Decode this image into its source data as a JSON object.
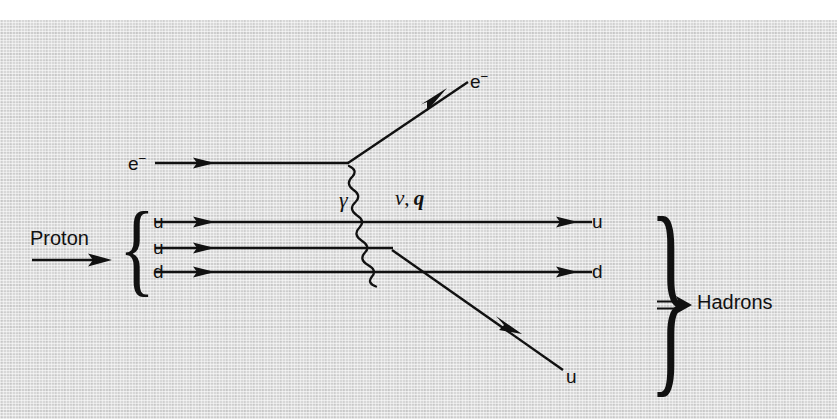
{
  "figure": {
    "kind": "feynman-diagram",
    "background_color": "#d8d8d8",
    "ink_color": "#111111",
    "width": 837,
    "height": 419
  },
  "labels": {
    "incoming_electron": "e",
    "incoming_electron_charge": "−",
    "outgoing_electron": "e",
    "outgoing_electron_charge": "−",
    "photon": "γ",
    "momentum_transfer_nu": "ν",
    "momentum_transfer_sep": ", ",
    "momentum_transfer_q": "q",
    "proton": "Proton",
    "hadrons": "Hadrons",
    "hadrons_arrow": "⇒",
    "quark_in_1": "u",
    "quark_in_2": "u",
    "quark_in_3": "d",
    "quark_out_1": "u",
    "quark_out_2": "d",
    "quark_out_struck": "u",
    "left_brace": "{",
    "right_brace": "}"
  },
  "geometry": {
    "electron_in_line": {
      "x1": 155,
      "y1": 163,
      "x2": 348,
      "y2": 163
    },
    "electron_in_arrow_at": {
      "x": 205,
      "y": 163
    },
    "electron_out_line": {
      "x1": 348,
      "y1": 163,
      "x2": 470,
      "y2": 80
    },
    "electron_out_arrow_at": {
      "x": 442,
      "y": 99
    },
    "photon_wave": {
      "x1": 348,
      "y1": 166,
      "x2": 392,
      "y2": 252,
      "amplitude": 6,
      "wavelength": 13
    },
    "quark_line_1": {
      "x1": 155,
      "y1": 222,
      "x2": 592,
      "y2": 222
    },
    "quark_line_2": {
      "x1": 155,
      "y1": 248,
      "x2": 392,
      "y2": 248
    },
    "quark_line_3": {
      "x1": 155,
      "y1": 272,
      "x2": 592,
      "y2": 272
    },
    "struck_quark_line": {
      "x1": 392,
      "y1": 252,
      "x2": 563,
      "y2": 370
    },
    "struck_quark_arrow_at": {
      "x": 520,
      "y": 340
    },
    "proton_arrow": {
      "x1": 35,
      "y1": 260,
      "x2": 110,
      "y2": 260
    },
    "hadrons_arrow": {
      "x1": 660,
      "y1": 305,
      "x2": 690,
      "y2": 305
    },
    "left_brace_span": {
      "x": 125,
      "y_top": 211,
      "y_bottom": 293
    },
    "right_brace_span": {
      "x": 632,
      "y_top": 218,
      "y_bottom": 392
    }
  }
}
